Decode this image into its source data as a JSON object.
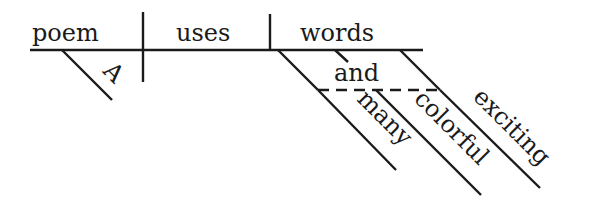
{
  "diagram": {
    "type": "sentence-diagram",
    "subject": "poem",
    "verb": "uses",
    "object": "words",
    "subject_modifiers": [
      "A"
    ],
    "object_modifiers": {
      "conjunction": "and",
      "coordinated": [
        "many",
        "colorful",
        "exciting"
      ]
    }
  },
  "colors": {
    "ink": "#1a1a1a",
    "background": "#ffffff"
  }
}
